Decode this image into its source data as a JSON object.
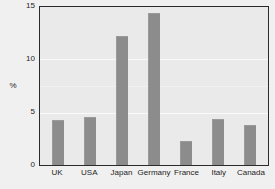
{
  "chart_data": {
    "type": "bar",
    "title": "",
    "subtitle": "",
    "xlabel": "",
    "ylabel": "%",
    "categories": [
      "UK",
      "USA",
      "Japan",
      "Germany",
      "France",
      "Italy",
      "Canada"
    ],
    "values": [
      4.2,
      4.5,
      12.2,
      14.4,
      2.2,
      4.3,
      3.7
    ],
    "ylim": [
      0,
      15
    ],
    "yticks": [
      0,
      5,
      10,
      15
    ],
    "ytick_labels": [
      "0",
      "5",
      "10",
      "15"
    ],
    "gridlines": [
      "5",
      "10"
    ],
    "grid": true,
    "legend": null,
    "annotations": [],
    "colors": {
      "bar": "#8c8c8c",
      "plot_background": "#eaeaea",
      "figure_background": "#f1f0f0",
      "axis_frame": "#2b2b2b",
      "gridline": "#fbfbfb",
      "text": "#1d1d1d"
    }
  }
}
